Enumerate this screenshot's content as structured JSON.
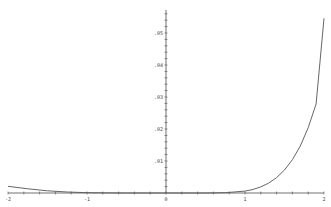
{
  "chart_data": {
    "type": "line",
    "title": "",
    "xlabel": "",
    "ylabel": "",
    "xlim": [
      -2,
      2
    ],
    "ylim": [
      0,
      0.055
    ],
    "grid": false,
    "x_ticks": [
      {
        "value": -2,
        "label": "-2"
      },
      {
        "value": -1,
        "label": "-1"
      },
      {
        "value": 0,
        "label": "0"
      },
      {
        "value": 1,
        "label": "1"
      },
      {
        "value": 2,
        "label": "2"
      }
    ],
    "y_ticks": [
      {
        "value": 0.01,
        "label": ".01"
      },
      {
        "value": 0.02,
        "label": ".02"
      },
      {
        "value": 0.03,
        "label": ".03"
      },
      {
        "value": 0.04,
        "label": ".04"
      },
      {
        "value": 0.05,
        "label": ".05"
      }
    ],
    "series": [
      {
        "name": "f(x)",
        "color": "#555555",
        "x": [
          -2,
          -1.75,
          -1.5,
          -1.25,
          -1,
          -0.75,
          -0.5,
          -0.25,
          0,
          0.25,
          0.5,
          0.75,
          1,
          1.1,
          1.2,
          1.3,
          1.4,
          1.5,
          1.6,
          1.7,
          1.8,
          1.9,
          2
        ],
        "y": [
          0.0021,
          0.0013,
          0.0007,
          0.0003,
          0.0001,
          3e-05,
          1e-05,
          0.0,
          0.0,
          0.0,
          1e-05,
          0.0001,
          0.0006,
          0.0011,
          0.0019,
          0.0031,
          0.0048,
          0.0072,
          0.0104,
          0.0147,
          0.0204,
          0.0278,
          0.0546
        ]
      }
    ]
  }
}
